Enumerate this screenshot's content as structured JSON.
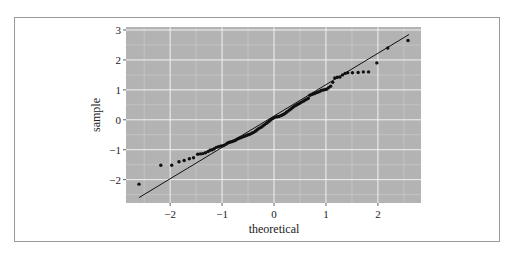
{
  "chart_data": {
    "type": "scatter",
    "title": "",
    "xlabel": "theoretical",
    "ylabel": "sample",
    "xlim": [
      -2.85,
      2.83
    ],
    "ylim": [
      -2.78,
      3.1
    ],
    "xticks": [
      -2,
      -1,
      0,
      1,
      2
    ],
    "yticks": [
      -2,
      -1,
      0,
      1,
      2,
      3
    ],
    "xtick_labels": [
      "−2",
      "−1",
      "0",
      "1",
      "2"
    ],
    "ytick_labels": [
      "−2",
      "−1",
      "0",
      "1",
      "2",
      "3"
    ],
    "grid": true,
    "legend": null,
    "reference_line": {
      "x": [
        -2.6,
        2.6
      ],
      "y": [
        -2.6,
        2.85
      ]
    },
    "series": [
      {
        "name": "sample quantiles",
        "points": [
          [
            -2.6,
            -2.15
          ],
          [
            -2.18,
            -1.52
          ],
          [
            -1.97,
            -1.52
          ],
          [
            -1.83,
            -1.4
          ],
          [
            -1.73,
            -1.36
          ],
          [
            -1.63,
            -1.3
          ],
          [
            -1.55,
            -1.27
          ],
          [
            -1.47,
            -1.15
          ],
          [
            -1.42,
            -1.14
          ],
          [
            -1.37,
            -1.13
          ],
          [
            -1.32,
            -1.1
          ],
          [
            -1.27,
            -1.06
          ],
          [
            -1.23,
            -1.02
          ],
          [
            -1.19,
            -1.0
          ],
          [
            -1.15,
            -0.97
          ],
          [
            -1.11,
            -0.92
          ],
          [
            -1.07,
            -0.9
          ],
          [
            -1.03,
            -0.88
          ],
          [
            -1.0,
            -0.87
          ],
          [
            -0.97,
            -0.86
          ],
          [
            -0.93,
            -0.82
          ],
          [
            -0.9,
            -0.78
          ],
          [
            -0.87,
            -0.76
          ],
          [
            -0.84,
            -0.74
          ],
          [
            -0.81,
            -0.73
          ],
          [
            -0.78,
            -0.71
          ],
          [
            -0.75,
            -0.69
          ],
          [
            -0.72,
            -0.66
          ],
          [
            -0.69,
            -0.63
          ],
          [
            -0.66,
            -0.61
          ],
          [
            -0.63,
            -0.59
          ],
          [
            -0.6,
            -0.57
          ],
          [
            -0.57,
            -0.55
          ],
          [
            -0.54,
            -0.53
          ],
          [
            -0.51,
            -0.51
          ],
          [
            -0.48,
            -0.49
          ],
          [
            -0.45,
            -0.47
          ],
          [
            -0.42,
            -0.44
          ],
          [
            -0.39,
            -0.42
          ],
          [
            -0.36,
            -0.38
          ],
          [
            -0.33,
            -0.34
          ],
          [
            -0.3,
            -0.3
          ],
          [
            -0.27,
            -0.27
          ],
          [
            -0.24,
            -0.24
          ],
          [
            -0.21,
            -0.2
          ],
          [
            -0.18,
            -0.16
          ],
          [
            -0.15,
            -0.12
          ],
          [
            -0.12,
            -0.08
          ],
          [
            -0.09,
            -0.04
          ],
          [
            -0.06,
            0.0
          ],
          [
            -0.03,
            0.04
          ],
          [
            0.0,
            0.07
          ],
          [
            0.03,
            0.09
          ],
          [
            0.06,
            0.1
          ],
          [
            0.09,
            0.11
          ],
          [
            0.12,
            0.13
          ],
          [
            0.15,
            0.15
          ],
          [
            0.18,
            0.18
          ],
          [
            0.21,
            0.21
          ],
          [
            0.24,
            0.25
          ],
          [
            0.27,
            0.29
          ],
          [
            0.3,
            0.33
          ],
          [
            0.33,
            0.37
          ],
          [
            0.36,
            0.41
          ],
          [
            0.39,
            0.45
          ],
          [
            0.42,
            0.48
          ],
          [
            0.45,
            0.51
          ],
          [
            0.48,
            0.54
          ],
          [
            0.51,
            0.57
          ],
          [
            0.54,
            0.6
          ],
          [
            0.57,
            0.63
          ],
          [
            0.6,
            0.66
          ],
          [
            0.63,
            0.69
          ],
          [
            0.66,
            0.72
          ],
          [
            0.69,
            0.82
          ],
          [
            0.72,
            0.84
          ],
          [
            0.75,
            0.86
          ],
          [
            0.78,
            0.88
          ],
          [
            0.81,
            0.9
          ],
          [
            0.84,
            0.92
          ],
          [
            0.87,
            0.94
          ],
          [
            0.9,
            0.97
          ],
          [
            0.93,
            0.99
          ],
          [
            0.96,
            1.0
          ],
          [
            0.99,
            1.01
          ],
          [
            1.02,
            1.03
          ],
          [
            1.05,
            1.07
          ],
          [
            1.09,
            1.12
          ],
          [
            1.13,
            1.25
          ],
          [
            1.17,
            1.4
          ],
          [
            1.22,
            1.42
          ],
          [
            1.27,
            1.43
          ],
          [
            1.32,
            1.5
          ],
          [
            1.37,
            1.55
          ],
          [
            1.42,
            1.57
          ],
          [
            1.51,
            1.57
          ],
          [
            1.62,
            1.58
          ],
          [
            1.72,
            1.6
          ],
          [
            1.82,
            1.6
          ],
          [
            1.98,
            1.9
          ],
          [
            2.19,
            2.4
          ],
          [
            2.58,
            2.65
          ]
        ]
      }
    ]
  },
  "colors": {
    "panel_background": "#b3b3b3",
    "major_grid": "#f2f2f2",
    "minor_grid": "#cfcfcf",
    "points": "#111111",
    "line": "#111111",
    "frame_border": "#9a9a9a"
  },
  "labels": {
    "xlabel": "theoretical",
    "ylabel": "sample"
  }
}
